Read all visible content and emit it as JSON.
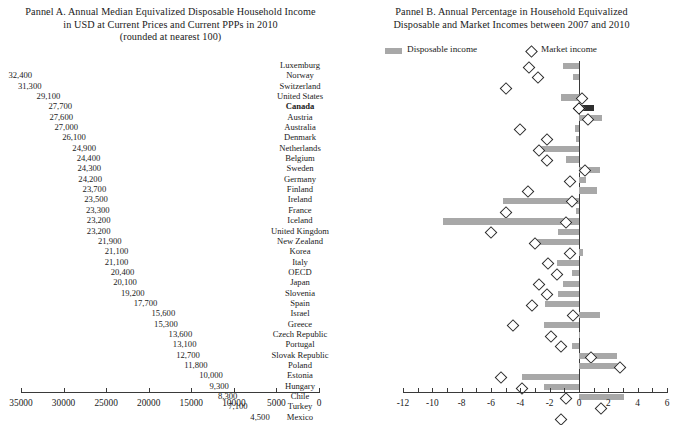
{
  "colors": {
    "bar": "#a8a8a8",
    "highlight_bar": "#2f2f2f",
    "axis": "#3a3a3a",
    "diamond_stroke": "#2b2b2b",
    "background": "#ffffff"
  },
  "panelA": {
    "title_line1": "Pannel A. Annual Median Equivalized Disposable Household Income",
    "title_line2": "in USD at Current Prices and Current PPPs in 2010",
    "title_line3": "(rounded at nearest 100)"
  },
  "panelB": {
    "title_line1": "Pannel B. Annual Percentage in Household Equivalized",
    "title_line2": "Disposable and Market Incomes between 2007 and 2010",
    "legend": [
      {
        "label": "Disposable income",
        "marker": "bar-swatch"
      },
      {
        "label": "Market income",
        "marker": "diamond-marker"
      }
    ]
  },
  "chart_data": [
    {
      "type": "bar",
      "id": "panel-a",
      "title": "Pannel A. Annual Median Equivalized Disposable Household Income in USD at Current Prices and Current PPPs in 2010 (rounded at nearest 100)",
      "orientation": "horizontal",
      "xlabel": "",
      "ylabel": "",
      "xlim": [
        35000,
        0
      ],
      "x_reversed": true,
      "xticks": [
        35000,
        30000,
        25000,
        20000,
        15000,
        10000,
        5000,
        0
      ],
      "xticklabels": [
        "35000",
        "30000",
        "25000",
        "20000",
        "15000",
        "10000",
        "5000",
        "0"
      ],
      "grid": false,
      "highlight_category": "Canada",
      "categories": [
        "Luxemburg",
        "Norway",
        "Switzerland",
        "United States",
        "Canada",
        "Austria",
        "Australia",
        "Denmark",
        "Netherlands",
        "Belgium",
        "Sweden",
        "Germany",
        "Finland",
        "Ireland",
        "France",
        "Iceland",
        "United Kingdom",
        "New Zealand",
        "Korea",
        "Italy",
        "OECD",
        "Japan",
        "Slovenia",
        "Spain",
        "Israel",
        "Greece",
        "Czech Republic",
        "Portugal",
        "Slovak Republic",
        "Poland",
        "Estonia",
        "Hungary",
        "Chile",
        "Turkey",
        "Mexico"
      ],
      "values": [
        36400,
        32400,
        31300,
        29100,
        27700,
        27600,
        27000,
        26100,
        24900,
        24400,
        24300,
        24200,
        23700,
        23500,
        23300,
        23200,
        23200,
        21900,
        21100,
        21100,
        20400,
        20100,
        19200,
        17700,
        15600,
        15300,
        13600,
        13100,
        12700,
        11800,
        10000,
        9300,
        8300,
        7100,
        4500
      ],
      "value_labels": [
        "36,400",
        "32,400",
        "31,300",
        "29,100",
        "27,700",
        "27,600",
        "27,000",
        "26,100",
        "24,900",
        "24,400",
        "24,300",
        "24,200",
        "23,700",
        "23,500",
        "23,300",
        "23,200",
        "23,200",
        "21,900",
        "21,100",
        "21,100",
        "20,400",
        "20,100",
        "19,200",
        "17,700",
        "15,600",
        "15,300",
        "13,600",
        "13,100",
        "12,700",
        "11,800",
        "10,000",
        "9,300",
        "8,300",
        "7,100",
        "4,500"
      ]
    },
    {
      "type": "bar",
      "id": "panel-b",
      "title": "Pannel B. Annual Percentage in Household Equivalized Disposable and Market Incomes between 2007 and 2010",
      "orientation": "horizontal",
      "xlabel": "",
      "ylabel": "",
      "xlim": [
        -12,
        6
      ],
      "xticks": [
        -12,
        -10,
        -8,
        -6,
        -4,
        -2,
        0,
        2,
        4,
        6
      ],
      "xticklabels": [
        "-12",
        "-10",
        "-8",
        "-6",
        "-4",
        "-2",
        "0",
        "2",
        "4",
        "6"
      ],
      "grid": false,
      "highlight_category": "Canada",
      "categories": [
        "Luxemburg",
        "Norway",
        "Switzerland",
        "United States",
        "Canada",
        "Austria",
        "Australia",
        "Denmark",
        "Netherlands",
        "Belgium",
        "Sweden",
        "Germany",
        "Finland",
        "Ireland",
        "France",
        "Iceland",
        "United Kingdom",
        "New Zealand",
        "Korea",
        "Italy",
        "OECD",
        "Japan",
        "Slovenia",
        "Spain",
        "Israel",
        "Greece",
        "Czech Republic",
        "Portugal",
        "Slovak Republic",
        "Poland",
        "Estonia",
        "Hungary",
        "Chile",
        "Turkey",
        "Mexico"
      ],
      "series": [
        {
          "name": "Disposable income",
          "type": "bar",
          "values": [
            -1.1,
            -0.4,
            0.0,
            -1.2,
            1.0,
            1.6,
            -0.3,
            -0.2,
            -2.6,
            -0.9,
            1.4,
            0.5,
            1.2,
            -5.2,
            -0.2,
            -9.3,
            -1.4,
            -2.9,
            0.3,
            -1.5,
            -0.5,
            -1.1,
            -1.4,
            -2.3,
            1.4,
            -2.4,
            0.1,
            -0.5,
            2.6,
            2.9,
            -3.9,
            -2.4,
            3.1,
            0.0,
            0.0
          ]
        },
        {
          "name": "Market income",
          "type": "scatter",
          "marker": "diamond",
          "values": [
            -3.4,
            -2.8,
            -5.0,
            0.2,
            0.0,
            0.6,
            -4.0,
            -2.2,
            -2.7,
            -2.2,
            0.4,
            -0.6,
            -3.5,
            -0.5,
            -5.0,
            -0.9,
            -6.0,
            -3.0,
            -0.6,
            -2.1,
            -1.5,
            -2.7,
            -2.2,
            -3.2,
            -0.4,
            -4.5,
            -1.9,
            -1.2,
            0.8,
            2.8,
            -5.3,
            -3.9,
            -0.9,
            1.5,
            -1.2
          ]
        }
      ]
    }
  ]
}
